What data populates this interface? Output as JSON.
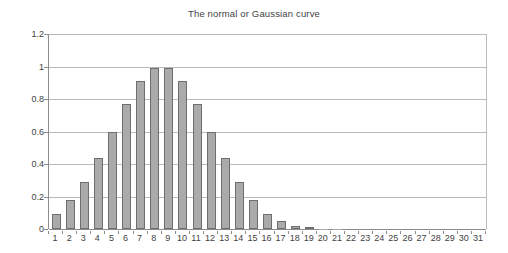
{
  "chart_data": {
    "type": "bar",
    "title": "The normal or Gaussian curve",
    "xlabel": "",
    "ylabel": "",
    "categories": [
      "1",
      "2",
      "3",
      "4",
      "5",
      "6",
      "7",
      "8",
      "9",
      "10",
      "11",
      "12",
      "13",
      "14",
      "15",
      "16",
      "17",
      "18",
      "19",
      "20",
      "21",
      "22",
      "23",
      "24",
      "25",
      "26",
      "27",
      "28",
      "29",
      "30",
      "31"
    ],
    "values": [
      0.09,
      0.18,
      0.29,
      0.44,
      0.6,
      0.77,
      0.91,
      0.99,
      0.99,
      0.91,
      0.77,
      0.6,
      0.44,
      0.29,
      0.18,
      0.09,
      0.05,
      0.02,
      0.007,
      0.002,
      0.001,
      0,
      0,
      0,
      0,
      0,
      0,
      0,
      0,
      0,
      0
    ],
    "ylim": [
      0,
      1.2
    ],
    "yticks": [
      0,
      0.2,
      0.4,
      0.6,
      0.8,
      1,
      1.2
    ],
    "ytick_labels": [
      "0",
      "0.2",
      "0.4",
      "0.6",
      "0.8",
      "1",
      "1.2"
    ],
    "grid": true,
    "legend": false,
    "legend_position": "none",
    "series": [
      {
        "name": "normal distribution",
        "values": [
          0.09,
          0.18,
          0.29,
          0.44,
          0.6,
          0.77,
          0.91,
          0.99,
          0.99,
          0.91,
          0.77,
          0.6,
          0.44,
          0.29,
          0.18,
          0.09,
          0.05,
          0.02,
          0.007,
          0.002,
          0.001,
          0,
          0,
          0,
          0,
          0,
          0,
          0,
          0,
          0,
          0
        ]
      }
    ],
    "colors": {
      "bar_fill": "#aaaaaa",
      "bar_border": "#6e6e6e",
      "gridline": "#b9b9b9",
      "axis": "#8c8c8c",
      "text": "#3f3f3f",
      "background": "#ffffff"
    }
  }
}
